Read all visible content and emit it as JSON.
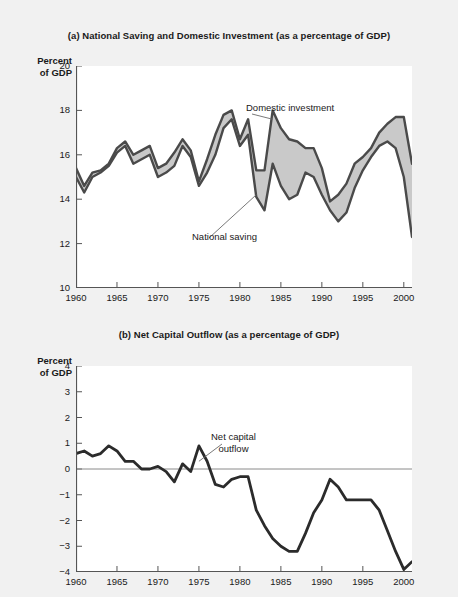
{
  "page": {
    "background_color": "#f1f1f1",
    "plot_background_color": "#ffffff",
    "line_color": "#4a4a4a",
    "fill_color": "#c9c9c9",
    "axis_color": "#555555"
  },
  "panel_a": {
    "title": "(a) National Saving and Domestic Investment (as a percentage of GDP)",
    "axis_caption_line1": "Percent",
    "axis_caption_line2": "of GDP",
    "annotation_investment": "Domestic investment",
    "annotation_saving": "National saving"
  },
  "panel_b": {
    "title": "(b) Net Capital Outflow (as a percentage of GDP)",
    "axis_caption_line1": "Percent",
    "axis_caption_line2": "of GDP",
    "annotation_line1": "Net capital",
    "annotation_line2": "outflow"
  },
  "chart_data": [
    {
      "type": "area",
      "id": "panel-a",
      "title": "(a) National Saving and Domestic Investment (as a percentage of GDP)",
      "xlabel": "",
      "ylabel": "Percent of GDP",
      "xlim": [
        1960,
        2001
      ],
      "ylim": [
        10,
        20
      ],
      "ytick_labels": [
        "10",
        "12",
        "14",
        "16",
        "18",
        "20"
      ],
      "yticks": [
        10,
        12,
        14,
        16,
        18,
        20
      ],
      "xtick_labels": [
        "1960",
        "1965",
        "1970",
        "1975",
        "1980",
        "1985",
        "1990",
        "1995",
        "2000"
      ],
      "xticks": [
        1960,
        1965,
        1970,
        1975,
        1980,
        1985,
        1990,
        1995,
        2000
      ],
      "grid": false,
      "legend": "annotations",
      "x": [
        1960,
        1961,
        1962,
        1963,
        1964,
        1965,
        1966,
        1967,
        1968,
        1969,
        1970,
        1971,
        1972,
        1973,
        1974,
        1975,
        1976,
        1977,
        1978,
        1979,
        1980,
        1981,
        1982,
        1983,
        1984,
        1985,
        1986,
        1987,
        1988,
        1989,
        1990,
        1991,
        1992,
        1993,
        1994,
        1995,
        1996,
        1997,
        1998,
        1999,
        2000,
        2001
      ],
      "series": [
        {
          "name": "Domestic investment",
          "values": [
            15.4,
            14.6,
            15.2,
            15.3,
            15.6,
            16.3,
            16.6,
            16.0,
            16.2,
            16.4,
            15.4,
            15.6,
            16.1,
            16.7,
            16.2,
            14.8,
            15.8,
            16.9,
            17.8,
            18.0,
            16.7,
            17.6,
            15.3,
            15.3,
            18.0,
            17.2,
            16.7,
            16.6,
            16.3,
            16.3,
            15.4,
            13.9,
            14.2,
            14.7,
            15.6,
            15.9,
            16.3,
            17.0,
            17.4,
            17.7,
            17.7,
            15.6
          ]
        },
        {
          "name": "National saving",
          "values": [
            15.0,
            14.3,
            15.0,
            15.2,
            15.5,
            16.1,
            16.4,
            15.6,
            15.8,
            16.0,
            15.0,
            15.2,
            15.5,
            16.4,
            15.9,
            14.6,
            15.2,
            16.0,
            17.2,
            17.6,
            16.4,
            16.9,
            14.1,
            13.5,
            15.6,
            14.6,
            14.0,
            14.2,
            15.2,
            15.0,
            14.2,
            13.5,
            13.0,
            13.4,
            14.5,
            15.3,
            15.9,
            16.4,
            16.6,
            16.3,
            15.0,
            12.3
          ]
        }
      ],
      "annotations": [
        {
          "text": "Domestic investment",
          "target_x": 1984,
          "target_y": 17.6
        },
        {
          "text": "National saving",
          "target_x": 1982,
          "target_y": 14.2
        }
      ]
    },
    {
      "type": "line",
      "id": "panel-b",
      "title": "(b) Net Capital Outflow (as a percentage of GDP)",
      "xlabel": "",
      "ylabel": "Percent of GDP",
      "xlim": [
        1960,
        2001
      ],
      "ylim": [
        -4,
        4
      ],
      "ytick_labels": [
        "-4",
        "-3",
        "-2",
        "-1",
        "0",
        "1",
        "2",
        "3",
        "4"
      ],
      "yticks": [
        -4,
        -3,
        -2,
        -1,
        0,
        1,
        2,
        3,
        4
      ],
      "xtick_labels": [
        "1960",
        "1965",
        "1970",
        "1975",
        "1980",
        "1985",
        "1990",
        "1995",
        "2000"
      ],
      "xticks": [
        1960,
        1965,
        1970,
        1975,
        1980,
        1985,
        1990,
        1995,
        2000
      ],
      "grid": false,
      "zero_line": true,
      "x": [
        1960,
        1961,
        1962,
        1963,
        1964,
        1965,
        1966,
        1967,
        1968,
        1969,
        1970,
        1971,
        1972,
        1973,
        1974,
        1975,
        1976,
        1977,
        1978,
        1979,
        1980,
        1981,
        1982,
        1983,
        1984,
        1985,
        1986,
        1987,
        1988,
        1989,
        1990,
        1991,
        1992,
        1993,
        1994,
        1995,
        1996,
        1997,
        1998,
        1999,
        2000,
        2001
      ],
      "series": [
        {
          "name": "Net capital outflow",
          "values": [
            0.6,
            0.7,
            0.5,
            0.6,
            0.9,
            0.7,
            0.3,
            0.3,
            0.0,
            0.0,
            0.1,
            -0.1,
            -0.5,
            0.2,
            -0.1,
            0.9,
            0.3,
            -0.6,
            -0.7,
            -0.4,
            -0.3,
            -0.3,
            -1.6,
            -2.2,
            -2.7,
            -3.0,
            -3.2,
            -3.2,
            -2.5,
            -1.7,
            -1.2,
            -0.4,
            -0.7,
            -1.2,
            -1.2,
            -1.2,
            -1.2,
            -1.6,
            -2.4,
            -3.2,
            -3.9,
            -3.6
          ]
        }
      ],
      "annotations": [
        {
          "text": "Net capital outflow",
          "target_x": 1975,
          "target_y": 0.3
        }
      ]
    }
  ]
}
